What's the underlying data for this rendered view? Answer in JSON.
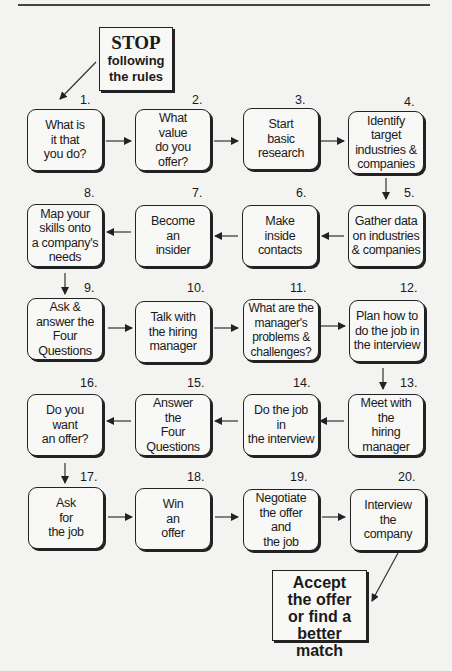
{
  "start_callout": {
    "title": "STOP",
    "subtitle": "following\nthe rules"
  },
  "steps": [
    {
      "num": "1.",
      "text": "What is\nit that\nyou do?"
    },
    {
      "num": "2.",
      "text": "What\nvalue\ndo you\noffer?"
    },
    {
      "num": "3.",
      "text": "Start\nbasic\nresearch"
    },
    {
      "num": "4.",
      "text": "Identify\ntarget\nindustries &\ncompanies"
    },
    {
      "num": "5.",
      "text": "Gather data\non industries\n& companies"
    },
    {
      "num": "6.",
      "text": "Make\ninside\ncontacts"
    },
    {
      "num": "7.",
      "text": "Become\nan\ninsider"
    },
    {
      "num": "8.",
      "text": "Map your\nskills onto\na company's\nneeds"
    },
    {
      "num": "9.",
      "text": "Ask &\nanswer the\nFour\nQuestions"
    },
    {
      "num": "10.",
      "text": "Talk with\nthe hiring\nmanager"
    },
    {
      "num": "11.",
      "text": "What are the\nmanager's\nproblems &\nchallenges?"
    },
    {
      "num": "12.",
      "text": "Plan how to\ndo the job in\nthe interview"
    },
    {
      "num": "13.",
      "text": "Meet with\nthe\nhiring\nmanager"
    },
    {
      "num": "14.",
      "text": "Do the job\nin\nthe interview"
    },
    {
      "num": "15.",
      "text": "Answer\nthe\nFour\nQuestions"
    },
    {
      "num": "16.",
      "text": "Do you\nwant\nan offer?"
    },
    {
      "num": "17.",
      "text": "Ask\nfor\nthe job"
    },
    {
      "num": "18.",
      "text": "Win\nan\noffer"
    },
    {
      "num": "19.",
      "text": "Negotiate\nthe offer\nand\nthe job"
    },
    {
      "num": "20.",
      "text": "Interview\nthe\ncompany"
    }
  ],
  "end_callout": {
    "text": "Accept\nthe offer\nor find a\nbetter match"
  },
  "colors": {
    "background": "#f3f3f1",
    "box_fill": "#f8f8f6",
    "stroke": "#222222"
  }
}
